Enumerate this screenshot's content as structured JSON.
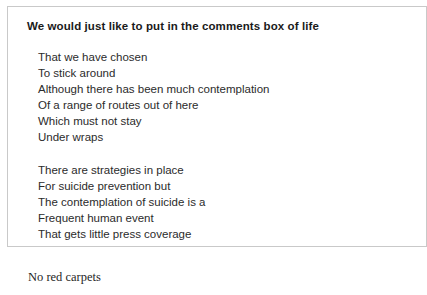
{
  "page": {
    "background_color": "#ffffff"
  },
  "excerpt_box": {
    "border_color": "#c9c9c9",
    "background_color": "#ffffff",
    "title": "We would just like to put in the comments box of life",
    "stanzas": [
      {
        "lines": [
          "That we have chosen",
          "To stick around",
          "Although there has been much contemplation",
          "Of a range of routes out of here",
          "Which must not stay",
          "Under wraps"
        ]
      },
      {
        "lines": [
          "There are strategies in place",
          "For suicide prevention but",
          "The contemplation of suicide is a",
          "Frequent human event",
          "That gets little press coverage"
        ]
      }
    ]
  },
  "trailing_caption": {
    "text": "No red carpets"
  }
}
